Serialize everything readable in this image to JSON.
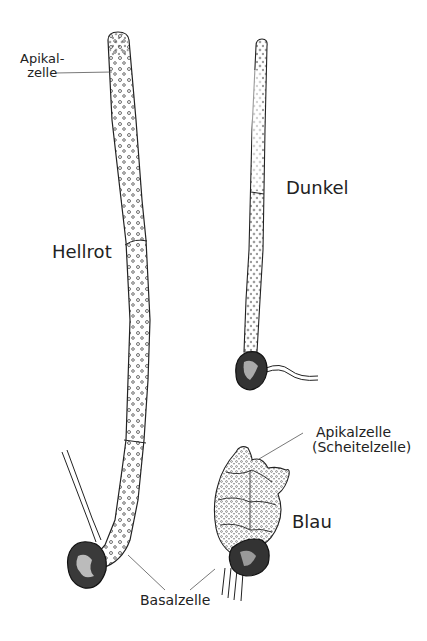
{
  "figure": {
    "specimens": [
      {
        "id": "hellrot",
        "label": "Hellrot",
        "description": "long filament with 3 cells, under light red"
      },
      {
        "id": "dunkel",
        "label": "Dunkel",
        "description": "thin filament with 2 cells, in darkness"
      },
      {
        "id": "blau",
        "label": "Blau",
        "description": "compact cell body, under blue light"
      }
    ],
    "annotations": {
      "apikalzelle_top_line1": "Apikal-",
      "apikalzelle_top_line2": "zelle",
      "apikalzelle_blau_line1": "Apikalzelle",
      "apikalzelle_blau_line2": "(Scheitelzelle)",
      "basalzelle": "Basalzelle"
    },
    "colors": {
      "ink": "#222222",
      "background": "#ffffff",
      "leader_line": "#555555"
    }
  }
}
